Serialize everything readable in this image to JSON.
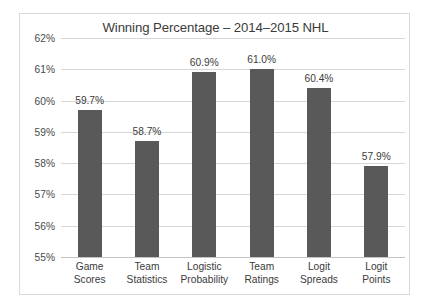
{
  "chart_data": {
    "type": "bar",
    "title": "Winning Percentage – 2014–2015 NHL",
    "xlabel": "",
    "ylabel": "",
    "ylim": [
      55,
      62
    ],
    "ytick_step": 1,
    "ytick_labels": [
      "62%",
      "61%",
      "60%",
      "59%",
      "58%",
      "57%",
      "56%",
      "55%"
    ],
    "ytick_values": [
      62,
      61,
      60,
      59,
      58,
      57,
      56,
      55
    ],
    "grid": true,
    "legend": false,
    "bar_color": "#595959",
    "gridline_color": "#d6d6d6",
    "categories": [
      "Game Scores",
      "Team Statistics",
      "Logistic Probability",
      "Team Ratings",
      "Logit Spreads",
      "Logit Points"
    ],
    "category_lines": [
      [
        "Game",
        "Scores"
      ],
      [
        "Team",
        "Statistics"
      ],
      [
        "Logistic",
        "Probability"
      ],
      [
        "Team",
        "Ratings"
      ],
      [
        "Logit",
        "Spreads"
      ],
      [
        "Logit",
        "Points"
      ]
    ],
    "values": [
      59.7,
      58.7,
      60.9,
      61.0,
      60.4,
      57.9
    ],
    "data_labels": [
      "59.7%",
      "58.7%",
      "60.9%",
      "61.0%",
      "60.4%",
      "57.9%"
    ]
  }
}
